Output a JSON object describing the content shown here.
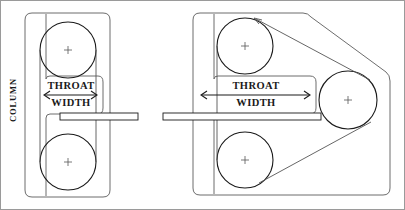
{
  "figure": {
    "background_color": "#ffffff",
    "line_color": "#1a1a1a",
    "thin_line_color": "#6d6d6d",
    "border_color": "#9a9a9a"
  },
  "labels": {
    "column": "COLUMN",
    "throat": "THROAT",
    "width": "WIDTH"
  },
  "panels": [
    {
      "id": "left-panel",
      "name": "two-wheel-bandsaw",
      "frame_shape": "rounded-rectangle",
      "wheel_count": 2,
      "wheels": [
        {
          "name": "upper-wheel",
          "cx": 68,
          "cy": 50,
          "r": 28
        },
        {
          "name": "lower-wheel",
          "cx": 68,
          "cy": 162,
          "r": 28
        }
      ],
      "throat_label_top": "THROAT",
      "throat_label_bottom": "WIDTH",
      "dimension_arrow": {
        "x1": 43,
        "x2": 98,
        "y": 95
      },
      "table_bar": {
        "x": 60,
        "y": 113,
        "w": 78,
        "h": 7
      }
    },
    {
      "id": "right-panel",
      "name": "three-wheel-bandsaw",
      "frame_shape": "rounded-polygon",
      "wheel_count": 3,
      "wheels": [
        {
          "name": "upper-wheel",
          "cx": 245,
          "cy": 46,
          "r": 28
        },
        {
          "name": "lower-wheel",
          "cx": 245,
          "cy": 160,
          "r": 28
        },
        {
          "name": "right-wheel",
          "cx": 348,
          "cy": 100,
          "r": 28
        }
      ],
      "throat_label_top": "THROAT",
      "throat_label_bottom": "WIDTH",
      "dimension_arrow": {
        "x1": 200,
        "x2": 310,
        "y": 95
      },
      "table_bar": {
        "x": 163,
        "y": 113,
        "w": 158,
        "h": 7
      }
    }
  ]
}
